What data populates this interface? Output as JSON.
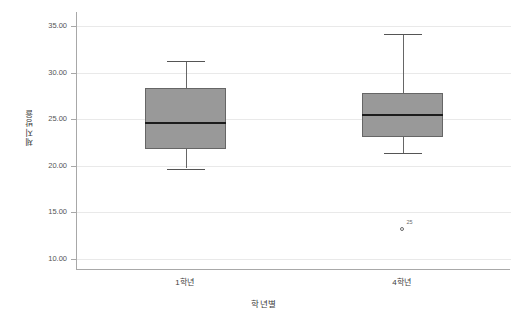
{
  "chart_data": {
    "type": "box",
    "title": "",
    "xlabel": "학년별",
    "ylabel": "체지방율",
    "categories": [
      "1학년",
      "4학년"
    ],
    "ylim": [
      8.8,
      36.5
    ],
    "yticks": [
      10,
      15,
      20,
      25,
      30,
      35
    ],
    "ytick_labels": [
      "10.00",
      "15.00",
      "20.00",
      "25.00",
      "30.00",
      "35.00"
    ],
    "grid": true,
    "legend": "none",
    "boxes": [
      {
        "category": "1학년",
        "whisker_low": 19.7,
        "q1": 21.8,
        "median": 24.6,
        "q3": 28.3,
        "whisker_high": 31.2,
        "outliers": []
      },
      {
        "category": "4학년",
        "whisker_low": 21.4,
        "q1": 23.1,
        "median": 25.4,
        "q3": 27.8,
        "whisker_high": 34.1,
        "outliers": [
          {
            "value": 13.2,
            "label": "25"
          }
        ]
      }
    ],
    "colors": {
      "box_fill": "#999999",
      "box_border": "#666666",
      "median": "#1c1c1c",
      "gridline": "#e9e9e9",
      "axis": "#a8a8a8",
      "outlier": "#6a6a6a"
    }
  }
}
